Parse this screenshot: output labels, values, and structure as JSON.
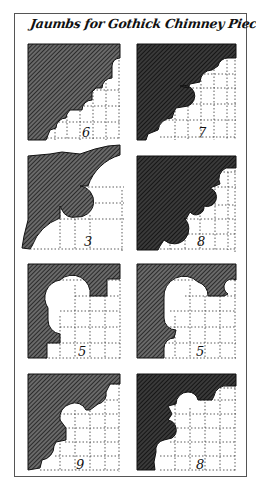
{
  "title": "Jaumbs for Gothick Chimney Pieces &c",
  "colors": {
    "ink": "#1a1a1a",
    "hatch_bg": "#4a4a4a",
    "grid": "#333333",
    "paper": "#ffffff",
    "frame": "#555555"
  },
  "panels": [
    {
      "id": "jamb-6",
      "label": "6",
      "row": 1,
      "column": "left"
    },
    {
      "id": "jamb-7",
      "label": "7",
      "row": 1,
      "column": "right"
    },
    {
      "id": "jamb-3",
      "label": "3",
      "row": 2,
      "column": "left"
    },
    {
      "id": "jamb-8a",
      "label": "8",
      "row": 2,
      "column": "right"
    },
    {
      "id": "jamb-5a",
      "label": "5",
      "row": 3,
      "column": "left"
    },
    {
      "id": "jamb-5b",
      "label": "5",
      "row": 3,
      "column": "right"
    },
    {
      "id": "jamb-9",
      "label": "9",
      "row": 4,
      "column": "left"
    },
    {
      "id": "jamb-8b",
      "label": "8",
      "row": 4,
      "column": "right"
    }
  ]
}
